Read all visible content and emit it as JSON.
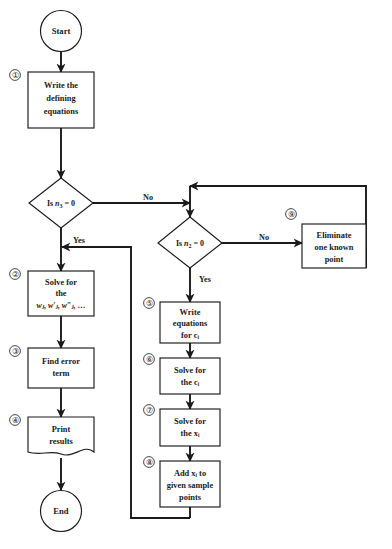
{
  "diagram": {
    "background_color": "#ffffff",
    "line_color": "#1a1a1a"
  },
  "terminators": {
    "start": "Start",
    "end": "End"
  },
  "steps": [
    {
      "number": "①",
      "name": "write-defining-equations",
      "lines": [
        "Write the",
        "defining",
        "equations"
      ]
    },
    {
      "number": "②",
      "name": "solve-for-w",
      "lines": [
        "Solve for",
        "the",
        "w"
      ]
    },
    {
      "number": "③",
      "name": "find-error-term",
      "lines": [
        "Find error",
        "term"
      ]
    },
    {
      "number": "④",
      "name": "print-results",
      "lines": [
        "Print",
        "results"
      ]
    },
    {
      "number": "⑤",
      "name": "write-equations-for-c",
      "lines": [
        "Write",
        "equations",
        "for c"
      ]
    },
    {
      "number": "⑥",
      "name": "solve-for-c",
      "lines": [
        "Solve for",
        "the c"
      ]
    },
    {
      "number": "⑦",
      "name": "solve-for-x",
      "lines": [
        "Solve for",
        "the x"
      ]
    },
    {
      "number": "⑧",
      "name": "add-x-to-sample-points",
      "lines": [
        "Add x",
        "given sample",
        "points"
      ]
    },
    {
      "number": "⑨",
      "name": "eliminate-known-point",
      "lines": [
        "Eliminate",
        "one known",
        "point"
      ]
    }
  ],
  "decisions": [
    {
      "name": "is-n3-zero",
      "prefix": "Is ",
      "var": "n",
      "sub": "3",
      "suffix": " = 0",
      "yes_label": "Yes",
      "no_label": "No"
    },
    {
      "name": "is-n2-zero",
      "prefix": "Is ",
      "var": "n",
      "sub": "2",
      "suffix": " = 0",
      "yes_label": "Yes",
      "no_label": "No"
    }
  ],
  "box_text": {
    "b1_l1": "Write the",
    "b1_l2": "defining",
    "b1_l3": "equations",
    "b2_l1": "Solve for",
    "b2_l2": "the",
    "b3_l1": "Find error",
    "b3_l2": "term",
    "b4_l1": "Print",
    "b4_l2": "results",
    "b5_l1": "Write",
    "b5_l2": "equations",
    "b6_l1": "Solve for",
    "b7_l1": "Solve for",
    "b8_l2": "given sample",
    "b8_l3": "points",
    "b9_l1": "Eliminate",
    "b9_l2": "one known",
    "b9_l3": "point"
  },
  "symbols": {
    "w_sequence": "wⱼ, w′ⱼ, w″ⱼ, …",
    "for_c_i": "for cᵢ",
    "the_c_i": "the cᵢ",
    "the_x_i": "the xᵢ",
    "add_x_i_to": "Add xᵢ to"
  },
  "edge_labels": {
    "d1_no": "No",
    "d1_yes": "Yes",
    "d2_no": "No",
    "d2_yes": "Yes"
  },
  "step_numbers": {
    "n1": "①",
    "n2": "②",
    "n3": "③",
    "n4": "④",
    "n5": "⑤",
    "n6": "⑥",
    "n7": "⑦",
    "n8": "⑧",
    "n9": "⑨"
  }
}
